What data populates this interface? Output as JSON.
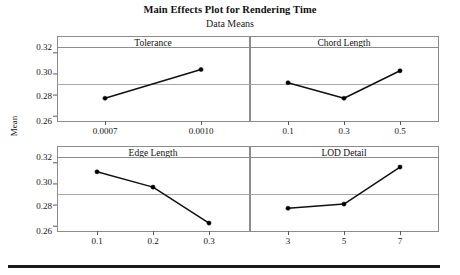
{
  "title": "Main Effects Plot for Rendering Time",
  "subtitle": "Data Means",
  "axis": {
    "ylabel": "Mean",
    "yticks": [
      "0.26",
      "0.28",
      "0.30",
      "0.32"
    ]
  },
  "panels": [
    {
      "name": "Tolerance",
      "xticks": [
        "0.0007",
        "0.0010"
      ]
    },
    {
      "name": "Chord Length",
      "xticks": [
        "0.1",
        "0.3",
        "0.5"
      ]
    },
    {
      "name": "Edge Length",
      "xticks": [
        "0.1",
        "0.2",
        "0.3"
      ]
    },
    {
      "name": "LOD Detail",
      "xticks": [
        "3",
        "5",
        "7"
      ]
    }
  ],
  "chart_data": {
    "type": "line",
    "title": "Main Effects Plot for Rendering Time",
    "subtitle": "Data Means",
    "ylabel": "Mean",
    "xlabel": "",
    "ylim": [
      0.255,
      0.325
    ],
    "yticks": [
      0.26,
      0.28,
      0.3,
      0.32
    ],
    "grid": true,
    "reference_line": 0.29,
    "legend": "none",
    "layout": "2x2 panel grid of main effects",
    "panels": [
      {
        "factor": "Tolerance",
        "categories": [
          "0.0007",
          "0.0010"
        ],
        "values": [
          0.2765,
          0.3037
        ]
      },
      {
        "factor": "Chord Length",
        "categories": [
          "0.1",
          "0.3",
          "0.5"
        ],
        "values": [
          0.2912,
          0.2765,
          0.3025
        ]
      },
      {
        "factor": "Edge Length",
        "categories": [
          "0.1",
          "0.2",
          "0.3"
        ],
        "values": [
          0.311,
          0.2965,
          0.2625
        ]
      },
      {
        "factor": "LOD Detail",
        "categories": [
          "3",
          "5",
          "7"
        ],
        "values": [
          0.2765,
          0.2805,
          0.3155
        ]
      }
    ]
  },
  "colors": {
    "line": "#111111",
    "marker": "#000000",
    "panel_border": "#8c8c8c",
    "gridline": "#a8a8a8",
    "rule": "#1a1a1a",
    "background": "#ffffff"
  }
}
